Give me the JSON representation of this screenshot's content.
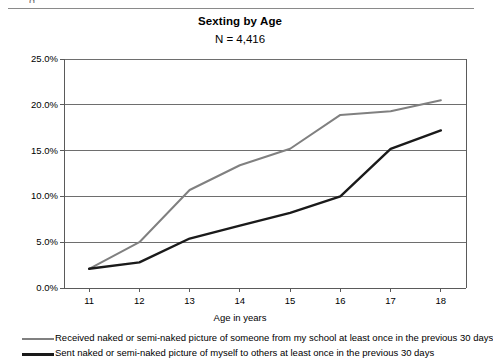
{
  "page": {
    "top_fragment_glyph": "g",
    "background": "#ffffff"
  },
  "header": {
    "title": "Sexting by Age",
    "subtitle": "N = 4,416"
  },
  "chart_data": {
    "type": "line",
    "title": "Sexting by Age",
    "subtitle": "N = 4,416",
    "xlabel": "Age in years",
    "ylabel": "",
    "categories": [
      "11",
      "12",
      "13",
      "14",
      "15",
      "16",
      "17",
      "18"
    ],
    "x": [
      11,
      12,
      13,
      14,
      15,
      16,
      17,
      18
    ],
    "xlim": [
      10.5,
      18.5
    ],
    "ylim": [
      0,
      25
    ],
    "ytick_labels": [
      "0.0%",
      "5.0%",
      "10.0%",
      "15.0%",
      "20.0%",
      "25.0%"
    ],
    "ytick_values": [
      0,
      5,
      10,
      15,
      20,
      25
    ],
    "grid": "horizontal",
    "legend_position": "bottom-left",
    "series": [
      {
        "name": "Received naked or semi-naked picture of someone from my school at least once in the previous 30 days",
        "color": "#808080",
        "width": 2,
        "values": [
          2.1,
          5.0,
          10.7,
          13.4,
          15.2,
          18.9,
          19.3,
          20.5
        ]
      },
      {
        "name": "Sent naked or semi-naked picture of myself to others at least once in the previous 30 days",
        "color": "#1a1a1a",
        "width": 2.4,
        "values": [
          2.1,
          2.8,
          5.4,
          6.8,
          8.2,
          10.0,
          15.2,
          17.2
        ]
      }
    ]
  },
  "axes": {
    "x_title": "Age in years",
    "x_ticks": [
      "11",
      "12",
      "13",
      "14",
      "15",
      "16",
      "17",
      "18"
    ],
    "y_ticks": [
      "25.0%",
      "20.0%",
      "15.0%",
      "10.0%",
      "5.0%",
      "0.0%"
    ],
    "axis_color": "#5a5a5a",
    "grid_color": "#6e6e6e"
  },
  "legend": {
    "items": [
      {
        "label": "Received naked or semi-naked picture of someone from my school at least once in the previous 30 days",
        "color": "#808080",
        "thickness": "2px"
      },
      {
        "label": "Sent naked or semi-naked picture of myself to others at least once in the previous 30 days",
        "color": "#1a1a1a",
        "thickness": "3px"
      }
    ]
  }
}
